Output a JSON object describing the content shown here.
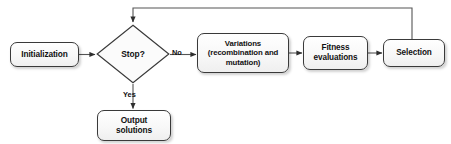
{
  "diagram": {
    "type": "flowchart",
    "background_color": "#ffffff",
    "line_color": "#555555",
    "node_border_color": "#3a3a3a",
    "node_fill_color": "#f7f7f7",
    "text_color": "#111111"
  },
  "nodes": {
    "initialization": {
      "label": "Initialization",
      "shape": "rounded-rectangle"
    },
    "decision": {
      "label": "Stop?",
      "shape": "diamond"
    },
    "variations": {
      "line1": "Variations",
      "line2": "(recombination and",
      "line3": "mutation)",
      "shape": "rounded-rectangle"
    },
    "fitness": {
      "line1": "Fitness",
      "line2": "evaluations",
      "shape": "rounded-rectangle"
    },
    "selection": {
      "label": "Selection",
      "shape": "rounded-rectangle"
    },
    "output": {
      "line1": "Output",
      "line2": "solutions",
      "shape": "rounded-rectangle"
    }
  },
  "edge_labels": {
    "no": "No",
    "yes": "Yes"
  }
}
